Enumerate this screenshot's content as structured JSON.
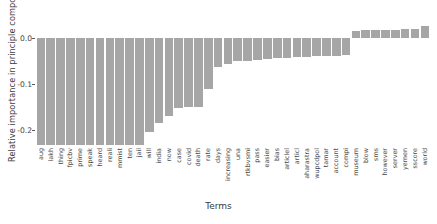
{
  "chart_data": {
    "type": "bar",
    "title": "",
    "xlabel": "Terms",
    "ylabel": "Relative importance in principle compor",
    "ylim": [
      -0.235,
      0.035
    ],
    "yticks": [
      0.0,
      -0.1,
      -0.2
    ],
    "ytick_labels": [
      "0.0",
      "-0.1",
      "-0.2"
    ],
    "grid": false,
    "legend": null,
    "bar_color": "#a6a6a6",
    "categories": [
      "aug",
      "lakh",
      "thing",
      "fpicbv",
      "prime",
      "speak",
      "heard",
      "reali",
      "mmist",
      "ten",
      "jail",
      "will",
      "india",
      "now",
      "case",
      "covid",
      "death",
      "rate",
      "days",
      "increasing",
      "una",
      "rtkbvsmi",
      "pass",
      "easier",
      "bias",
      "articlel",
      "articl",
      "aharastra",
      "wupcdpol",
      "tamar",
      "account",
      "compi",
      "museum",
      "blow",
      "sms",
      "however",
      "server",
      "yemen",
      "sscore",
      "world"
    ],
    "values": [
      -0.232,
      -0.232,
      -0.232,
      -0.232,
      -0.232,
      -0.232,
      -0.232,
      -0.232,
      -0.232,
      -0.232,
      -0.232,
      -0.205,
      -0.186,
      -0.17,
      -0.153,
      -0.15,
      -0.15,
      -0.112,
      -0.062,
      -0.056,
      -0.05,
      -0.049,
      -0.047,
      -0.045,
      -0.044,
      -0.043,
      -0.042,
      -0.041,
      -0.04,
      -0.039,
      -0.038,
      -0.036,
      0.016,
      0.017,
      0.017,
      0.018,
      0.018,
      0.019,
      0.02,
      0.026
    ]
  },
  "axis": {
    "x_title": "Terms",
    "y_title": "Relative importance in principle compor"
  }
}
